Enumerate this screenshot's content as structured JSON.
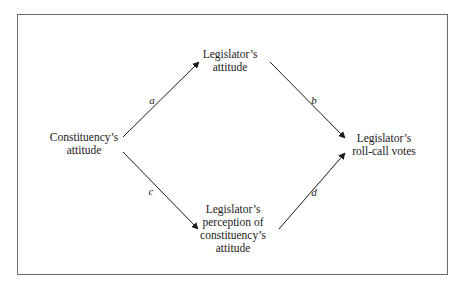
{
  "diagram": {
    "nodes": {
      "constituency_attitude": {
        "lines": [
          "Constituency’s",
          "attitude"
        ]
      },
      "legislator_attitude": {
        "lines": [
          "Legislator’s",
          "attitude"
        ]
      },
      "legislator_perception": {
        "lines": [
          "Legislator’s",
          "perception of",
          "constituency’s",
          "attitude"
        ]
      },
      "roll_call_votes": {
        "lines": [
          "Legislator’s",
          "roll-call votes"
        ]
      }
    },
    "edges": [
      {
        "id": "a",
        "label": "a",
        "from": "Constituency’s attitude",
        "to": "Legislator’s attitude"
      },
      {
        "id": "b",
        "label": "b",
        "from": "Legislator’s attitude",
        "to": "Legislator’s roll-call votes"
      },
      {
        "id": "c",
        "label": "c",
        "from": "Constituency’s attitude",
        "to": "Legislator’s perception of constituency’s attitude"
      },
      {
        "id": "d",
        "label": "d",
        "from": "Legislator’s perception of constituency’s attitude",
        "to": "Legislator’s roll-call votes"
      }
    ],
    "colors": {
      "line": "#1a1a1a",
      "frame": "#6a6a6a",
      "background": "#ffffff"
    }
  }
}
